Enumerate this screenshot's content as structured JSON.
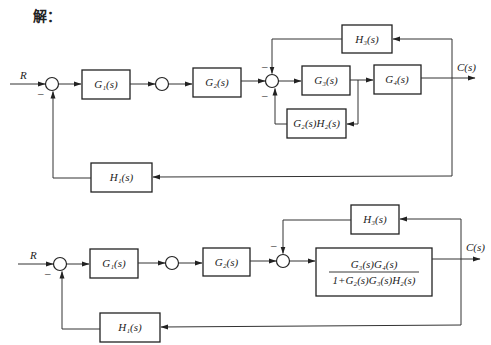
{
  "title": "解：",
  "diagram_top": {
    "input_label": "R",
    "output_label": "C(s)",
    "blocks": {
      "g1": "G₁(s)",
      "g2": "G₂(s)",
      "g3": "G₃(s)",
      "g4": "G₄(s)",
      "h3": "H₃(s)",
      "g2h2": "G₂(s)H₂(s)",
      "h1": "H₁(s)"
    },
    "signs": {
      "sum1_bottom": "–",
      "sum3_top": "–",
      "sum3_bottom": "–"
    }
  },
  "diagram_bottom": {
    "input_label": "R",
    "output_label": "C(s)",
    "blocks": {
      "g1": "G₁(s)",
      "g2": "G₂(s)",
      "h3": "H₃(s)",
      "h1": "H₁(s)",
      "combined_numerator": "G₃(s)G₄(s)",
      "combined_denominator": "1+G₂(s)G₃(s)H₂(s)"
    },
    "signs": {
      "sum1_bottom": "–",
      "sum3_top": "–"
    }
  }
}
